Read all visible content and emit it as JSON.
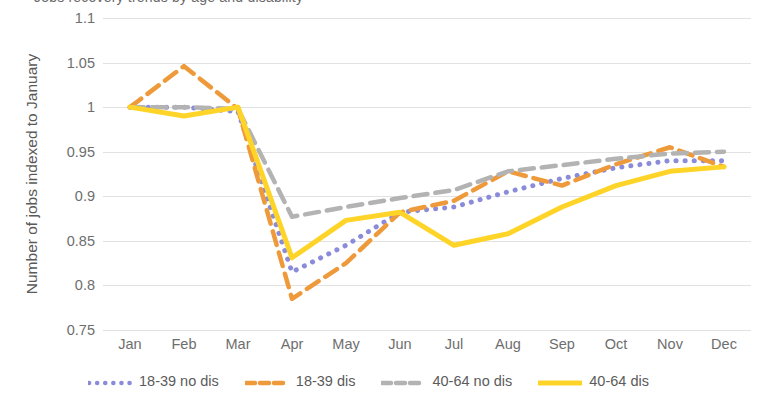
{
  "title_partial": "Jobs recovery trends by age and disability",
  "chart_data": {
    "type": "line",
    "title": "",
    "xlabel": "",
    "ylabel": "Number of jobs indexed to January",
    "categories": [
      "Jan",
      "Feb",
      "Mar",
      "Apr",
      "May",
      "Jun",
      "Jul",
      "Aug",
      "Sep",
      "Oct",
      "Nov",
      "Dec"
    ],
    "ylim": [
      0.75,
      1.1
    ],
    "yticks": [
      "0.75",
      "0.8",
      "0.85",
      "0.9",
      "0.95",
      "1",
      "1.05",
      "1.1"
    ],
    "ytick_values": [
      0.75,
      0.8,
      0.85,
      0.9,
      0.95,
      1.0,
      1.05,
      1.1
    ],
    "grid": true,
    "legend_position": "bottom",
    "series": [
      {
        "name": "18-39 no dis",
        "color": "#8A8CD9",
        "style": "dotted",
        "values": [
          1.0,
          1.0,
          0.995,
          0.815,
          0.845,
          0.882,
          0.888,
          0.905,
          0.92,
          0.932,
          0.94,
          0.94
        ]
      },
      {
        "name": "18-39 dis",
        "color": "#EE9A3A",
        "style": "dashed",
        "values": [
          1.0,
          1.046,
          0.998,
          0.785,
          0.825,
          0.882,
          0.895,
          0.928,
          0.912,
          0.936,
          0.955,
          0.933
        ]
      },
      {
        "name": "40-64 no dis",
        "color": "#B3B3B3",
        "style": "dashed",
        "values": [
          1.0,
          1.0,
          0.998,
          0.877,
          0.888,
          0.898,
          0.907,
          0.928,
          0.935,
          0.942,
          0.948,
          0.95
        ]
      },
      {
        "name": "40-64 dis",
        "color": "#FFD428",
        "style": "solid",
        "values": [
          1.0,
          0.99,
          1.0,
          0.831,
          0.873,
          0.882,
          0.845,
          0.858,
          0.888,
          0.912,
          0.928,
          0.933
        ]
      }
    ]
  }
}
